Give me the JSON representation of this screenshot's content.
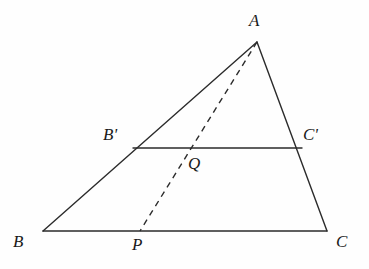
{
  "figure": {
    "background_color": "#fefefe",
    "stroke_color": "#2b2b2b",
    "canvas": {
      "width": 369,
      "height": 269
    }
  },
  "points": {
    "A": {
      "label": "A",
      "x": 257,
      "y": 42,
      "label_x": 249,
      "label_y": 12
    },
    "B": {
      "label": "B",
      "x": 43,
      "y": 231,
      "label_x": 13,
      "label_y": 233
    },
    "C": {
      "label": "C",
      "x": 327,
      "y": 231,
      "label_x": 336,
      "label_y": 233
    },
    "Bp": {
      "label": "B",
      "prime": "'",
      "x": 133,
      "y": 148,
      "label_x": 103,
      "label_y": 126
    },
    "Cp": {
      "label": "C",
      "prime": "'",
      "x": 296,
      "y": 148,
      "label_x": 303,
      "label_y": 126
    },
    "P": {
      "label": "P",
      "x": 140,
      "y": 231,
      "label_x": 132,
      "label_y": 236
    },
    "Q": {
      "label": "Q",
      "x": 189,
      "y": 148,
      "label_x": 188,
      "label_y": 155
    }
  },
  "segments": [
    {
      "name": "side-ab",
      "from": "B",
      "to": "A",
      "style": "solid",
      "width": 1.4
    },
    {
      "name": "side-ac",
      "from": "A",
      "to": "C",
      "style": "solid",
      "width": 1.4
    },
    {
      "name": "side-bc",
      "from": "B",
      "to": "C",
      "style": "solid",
      "width": 1.4
    },
    {
      "name": "midline-bpcp",
      "from": "Bp",
      "to": "Cp",
      "style": "solid",
      "width": 1.4
    },
    {
      "name": "cevian-ap",
      "from": "A",
      "to": "P",
      "style": "dashed",
      "width": 1.4
    }
  ],
  "labels": {
    "A": "A",
    "B": "B",
    "C": "C",
    "B_prime": "B'",
    "C_prime": "C'",
    "P": "P",
    "Q": "Q"
  }
}
